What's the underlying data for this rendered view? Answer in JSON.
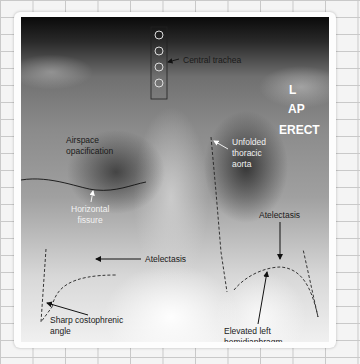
{
  "image": {
    "description": "Annotated AP erect chest X-ray",
    "background": "graph-paper grid",
    "markers": {
      "side": "L",
      "projection": "AP",
      "position": "ERECT"
    },
    "annotations": [
      {
        "id": "central-trachea",
        "text": "Central trachea",
        "color": "#1a1a1a"
      },
      {
        "id": "airspace-opacification",
        "text": "Airspace opacification",
        "lines": [
          "Airspace",
          "opacification"
        ],
        "color": "#1a1a1a"
      },
      {
        "id": "unfolded-thoracic-aorta",
        "text": "Unfolded thoracic aorta",
        "lines": [
          "Unfolded",
          "thoracic",
          "aorta"
        ],
        "color": "#f2f2f2"
      },
      {
        "id": "horizontal-fissure",
        "text": "Horizontal fissure",
        "lines": [
          "Horizontal",
          "fissure"
        ],
        "color": "#f2f2f2"
      },
      {
        "id": "atelectasis-left",
        "text": "Atelectasis",
        "color": "#1a1a1a"
      },
      {
        "id": "atelectasis-right",
        "text": "Atelectasis",
        "color": "#1a1a1a"
      },
      {
        "id": "elevated-left-hemidiaphragm",
        "text": "Elevated left hemidiaphragm",
        "lines": [
          "Elevated left",
          "hemidiaphragm"
        ],
        "color": "#1a1a1a"
      },
      {
        "id": "sharp-costophrenic-angle",
        "text": "Sharp costophrenic angle",
        "lines": [
          "Sharp costophrenic",
          "angle"
        ],
        "color": "#1a1a1a"
      }
    ]
  }
}
